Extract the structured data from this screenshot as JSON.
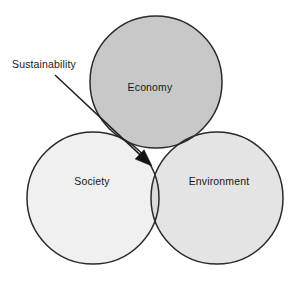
{
  "diagram": {
    "type": "venn-3-circle",
    "title_text": "Sustainability",
    "background_color": "#ffffff",
    "stroke_color": "#2a2a2a",
    "circles": [
      {
        "key": "economy",
        "label": "Economy",
        "fill": "#c8c8c8",
        "cx": 156,
        "cy": 82,
        "r": 66,
        "label_x": 150,
        "label_y": 88
      },
      {
        "key": "society",
        "label": "Society",
        "fill": "#f0f0f0",
        "cx": 93,
        "cy": 198,
        "r": 66,
        "label_x": 92,
        "label_y": 182
      },
      {
        "key": "environment",
        "label": "Environment",
        "fill": "#e4e4e4",
        "cx": 217,
        "cy": 198,
        "r": 66,
        "label_x": 219,
        "label_y": 182
      }
    ],
    "intersections": [
      {
        "key": "economy-society",
        "fill": "#c0c0c0"
      },
      {
        "key": "society-environment",
        "fill": "#dcdcdc"
      },
      {
        "key": "economy-environment",
        "fill": "#1a1a1a"
      },
      {
        "key": "economy-society-environment",
        "fill": "#a8a8a8"
      }
    ],
    "callout": {
      "label": "Sustainability",
      "label_x": 12,
      "label_y": 65,
      "line_start_x": 55,
      "line_start_y": 75,
      "line_end_x": 152,
      "line_end_y": 166,
      "arrow_color": "#131313"
    }
  }
}
